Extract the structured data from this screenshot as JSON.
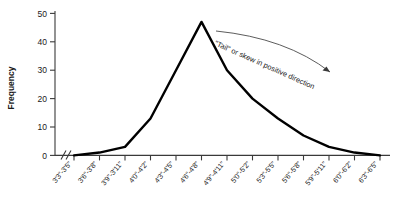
{
  "chart_data": {
    "type": "line",
    "title": "",
    "xlabel": "",
    "ylabel": "Frequency",
    "ylim": [
      0,
      50
    ],
    "yticks": [
      0,
      10,
      20,
      30,
      40,
      50
    ],
    "grid": false,
    "legend": "none",
    "categories": [
      "3'3\"-3'5\"",
      "3'6\"-3'8\"",
      "3'9\"-3'11\"",
      "4'0\"-4'2\"",
      "4'3\"-4'5\"",
      "4'6\"-4'8\"",
      "4'9\"-4'11\"",
      "5'0\"-5'2\"",
      "5'3\"-5'5\"",
      "5'6\"-5'8\"",
      "5'9\"-5'11\"",
      "6'0\"-6'2\"",
      "6'3\"-6'5\""
    ],
    "values": [
      0,
      1,
      3,
      13,
      30,
      47,
      30,
      20,
      13,
      7,
      3,
      1,
      0
    ],
    "series": [
      {
        "name": "Frequency",
        "values": [
          0,
          1,
          3,
          13,
          30,
          47,
          30,
          20,
          13,
          7,
          3,
          1,
          0
        ]
      }
    ],
    "annotations": [
      {
        "name": "skew-annotation",
        "text": "\"Tail\" or skew in positive direction"
      }
    ],
    "axis_break": true
  },
  "icons": {
    "arrow": "arrow-right-icon"
  }
}
